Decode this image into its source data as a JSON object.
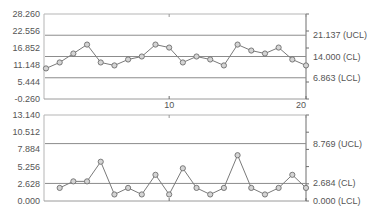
{
  "colors": {
    "background": "#ffffff",
    "frame": "#9a9a9a",
    "limit_line": "#8c8c8c",
    "series_line": "#7a7a7a",
    "marker_fill": "#d4d4d4",
    "marker_stroke": "#6e6e6e",
    "text": "#555555"
  },
  "chart_data": [
    {
      "type": "line",
      "title": "Individuals (X) Chart",
      "x": [
        1,
        2,
        3,
        4,
        5,
        6,
        7,
        8,
        9,
        10,
        11,
        12,
        13,
        14,
        15,
        16,
        17,
        18,
        19,
        20
      ],
      "values": [
        10,
        12,
        15,
        18,
        12,
        11,
        13,
        14,
        18,
        17,
        12,
        14,
        13,
        11,
        18,
        16,
        15,
        17,
        13,
        11
      ],
      "ylim": [
        -0.26,
        28.26
      ],
      "y_ticks": [
        "28.260",
        "22.556",
        "16.852",
        "11.148",
        "5.444",
        "-0.260"
      ],
      "y_tick_values": [
        28.26,
        22.556,
        16.852,
        11.148,
        5.444,
        -0.26
      ],
      "x_ticks": [
        {
          "value": 10,
          "label": "10"
        },
        {
          "value": 20,
          "label": "20"
        }
      ],
      "limits": [
        {
          "name": "UCL",
          "value": 21.137,
          "label": "21.137 (UCL)"
        },
        {
          "name": "CL",
          "value": 14.0,
          "label": "14.000 (CL)"
        },
        {
          "name": "LCL",
          "value": 6.863,
          "label": "6.863 (LCL)"
        }
      ],
      "grid": false
    },
    {
      "type": "line",
      "title": "Moving Range (MR) Chart",
      "x": [
        2,
        3,
        4,
        5,
        6,
        7,
        8,
        9,
        10,
        11,
        12,
        13,
        14,
        15,
        16,
        17,
        18,
        19,
        20
      ],
      "values": [
        2,
        3,
        3,
        6,
        1,
        2,
        1,
        4,
        1,
        5,
        2,
        1,
        2,
        7,
        2,
        1,
        2,
        4,
        2
      ],
      "ylim": [
        0.0,
        13.14
      ],
      "y_ticks": [
        "13.140",
        "10.512",
        "7.884",
        "5.256",
        "2.628",
        "0.000"
      ],
      "y_tick_values": [
        13.14,
        10.512,
        7.884,
        5.256,
        2.628,
        0.0
      ],
      "x_ticks": [
        {
          "value": 10,
          "label": ""
        },
        {
          "value": 20,
          "label": ""
        }
      ],
      "limits": [
        {
          "name": "UCL",
          "value": 8.769,
          "label": "8.769 (UCL)"
        },
        {
          "name": "CL",
          "value": 2.684,
          "label": "2.684 (CL)"
        },
        {
          "name": "LCL",
          "value": 0.0,
          "label": "0.000 (LCL)"
        }
      ],
      "grid": false
    }
  ],
  "layout": {
    "plot_left": 44,
    "plot_right": 306,
    "x_first": 46,
    "x_last": 306,
    "x_min": 1,
    "x_max": 20,
    "panels": [
      {
        "top": 14,
        "bottom": 99
      },
      {
        "top": 115,
        "bottom": 201
      }
    ]
  }
}
